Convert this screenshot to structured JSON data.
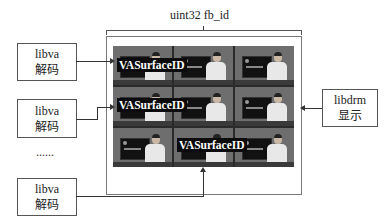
{
  "diagram": {
    "top_label": "uint32 fb_id",
    "decoders": [
      {
        "line1": "libva",
        "line2": "解码"
      },
      {
        "line1": "libva",
        "line2": "解码"
      },
      {
        "line1": "libva",
        "line2": "解码"
      }
    ],
    "ellipsis": "......",
    "display": {
      "line1": "libdrm",
      "line2": "显示"
    },
    "surface_labels": [
      "VASurfaceID",
      "VASurfaceID",
      "VASurfaceID"
    ],
    "grid": {
      "rows": 3,
      "cols": 3
    },
    "colors": {
      "border": "#555555",
      "cell_bg": "#6e6e6e",
      "label_bg": "#0b0b0b",
      "label_text": "#ffffff"
    }
  }
}
